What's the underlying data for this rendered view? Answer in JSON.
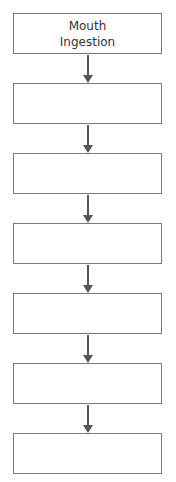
{
  "flowchart": {
    "boxes": [
      {
        "label": "Mouth\nIngestion",
        "line1": "Mouth",
        "line2": "Ingestion"
      },
      {
        "label": ""
      },
      {
        "label": ""
      },
      {
        "label": ""
      },
      {
        "label": ""
      },
      {
        "label": ""
      },
      {
        "label": ""
      }
    ],
    "arrow_count": 6,
    "colors": {
      "border": "#7a7a7a",
      "arrow": "#555555",
      "background": "#ffffff"
    }
  }
}
